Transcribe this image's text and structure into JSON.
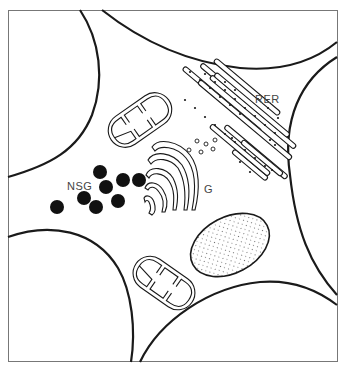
{
  "diagram": {
    "type": "cell-ultrastructure-illustration",
    "labels": {
      "rer": "RER",
      "golgi": "G",
      "secretory_granules": "NSG"
    },
    "components": [
      {
        "id": "rer",
        "name": "rough endoplasmic reticulum",
        "label_key": "rer"
      },
      {
        "id": "golgi",
        "name": "Golgi apparatus",
        "label_key": "golgi"
      },
      {
        "id": "nsg",
        "name": "neurosecretory granules",
        "label_key": "secretory_granules",
        "count": 8
      },
      {
        "id": "mitochondrion-upper",
        "name": "mitochondrion"
      },
      {
        "id": "mitochondrion-lower",
        "name": "mitochondrion"
      },
      {
        "id": "stippled-body",
        "name": "stippled organelle"
      },
      {
        "id": "vesicles",
        "name": "small vesicles",
        "count": 6
      },
      {
        "id": "neighbor-cells",
        "name": "adjacent cell outlines",
        "count": 4
      }
    ],
    "colors": {
      "line": "#1a1a1a",
      "background": "#ffffff",
      "frame": "#777777",
      "label": "#444444"
    }
  }
}
